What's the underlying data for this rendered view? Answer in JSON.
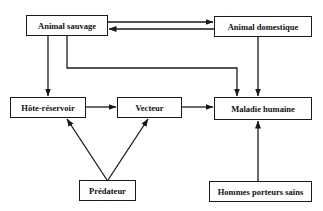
{
  "diagram": {
    "type": "flowchart",
    "language": "fr",
    "colors": {
      "line": "#1a1a1a",
      "text": "#111111",
      "background": "#ffffff"
    },
    "nodes": [
      {
        "id": "animal_sauvage",
        "label": "Animal sauvage"
      },
      {
        "id": "animal_domestique",
        "label": "Animal domestique"
      },
      {
        "id": "hote_reservoir",
        "label": "Hôte-réservoir"
      },
      {
        "id": "vecteur",
        "label": "Vecteur"
      },
      {
        "id": "maladie_humaine",
        "label": "Maladie humaine"
      },
      {
        "id": "predateur",
        "label": "Prédateur"
      },
      {
        "id": "hommes_porteurs_sains",
        "label": "Hommes porteurs sains"
      }
    ],
    "edges": [
      {
        "from": "animal_sauvage",
        "to": "animal_domestique"
      },
      {
        "from": "animal_domestique",
        "to": "animal_sauvage"
      },
      {
        "from": "animal_sauvage",
        "to": "hote_reservoir"
      },
      {
        "from": "animal_sauvage",
        "to": "maladie_humaine"
      },
      {
        "from": "animal_domestique",
        "to": "maladie_humaine"
      },
      {
        "from": "hote_reservoir",
        "to": "vecteur"
      },
      {
        "from": "vecteur",
        "to": "maladie_humaine"
      },
      {
        "from": "predateur",
        "to": "hote_reservoir"
      },
      {
        "from": "predateur",
        "to": "vecteur"
      },
      {
        "from": "hommes_porteurs_sains",
        "to": "maladie_humaine"
      }
    ]
  }
}
